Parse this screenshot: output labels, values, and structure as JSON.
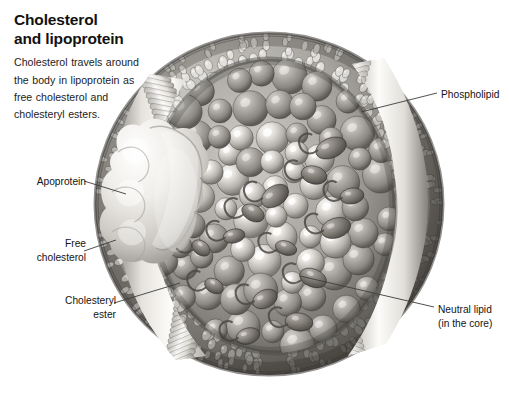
{
  "heading": {
    "title_line_1": "Cholesterol",
    "title_line_2": "and lipoprotein",
    "body": "Cholesterol travels around the body in lipoprotein as free cholesterol and cholesteryl esters."
  },
  "labels": {
    "phospholipid": "Phospholipid",
    "apoprotein": "Apoprotein",
    "free_cholesterol_line_1": "Free",
    "free_cholesterol_line_2": "cholesterol",
    "cholesteryl_ester_line_1": "Cholesteryl",
    "cholesteryl_ester_line_2": "ester",
    "neutral_lipid_line_1": "Neutral lipid",
    "neutral_lipid_line_2": "(in the core)"
  },
  "diagram": {
    "name": "lipoprotein-particle-cutaway",
    "style": "grayscale airbrush scientific illustration",
    "parts": [
      "phospholipid-monolayer-shell",
      "apoprotein-surface-protein",
      "free-cholesterol-molecules",
      "cholesteryl-ester-molecules",
      "neutral-lipid-core-droplets"
    ]
  },
  "colors": {
    "background": "#ffffff",
    "text": "#141414",
    "leader_line": "#3c3c3c",
    "shell_light": "#f2f0ec",
    "shell_mid": "#b9b6b0",
    "shell_dark": "#6f6c68",
    "core_sphere_light": "#eceae6",
    "core_sphere_mid": "#bdbab5",
    "core_sphere_shadow": "#7c7975",
    "lipid_droplet": "#8a8680",
    "apoprotein": "#f4f2ee"
  }
}
